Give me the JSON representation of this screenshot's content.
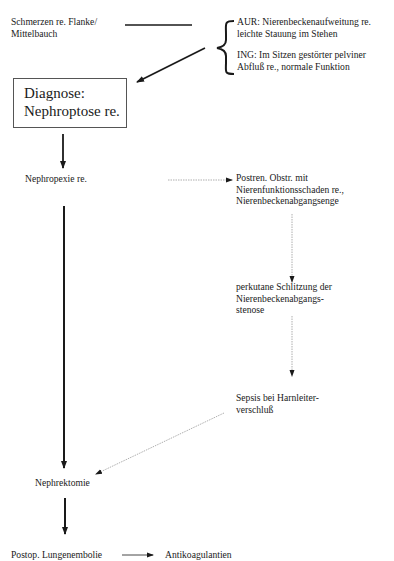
{
  "diagram": {
    "type": "flowchart",
    "nodes": {
      "symptom": {
        "line1": "Schmerzen re. Flanke/",
        "line2": "Mittelbauch"
      },
      "aur": {
        "line1": "AUR: Nierenbeckenaufweitung re.",
        "line2": "leichte Stauung im Stehen"
      },
      "ing": {
        "line1": "ING: Im Sitzen gestörter pelviner",
        "line2": "Abfluß re., normale Funktion"
      },
      "diagnosis": {
        "line1": "Diagnose:",
        "line2": "Nephroptose re."
      },
      "nephropexie": {
        "label": "Nephropexie re."
      },
      "postren": {
        "line1": "Postren. Obstr. mit",
        "line2": "Nierenfunktionsschaden re.,",
        "line3": "Nierenbeckenabgangsenge"
      },
      "perkutane": {
        "line1": "perkutane Schlitzung der",
        "line2": "Nierenbeckenabgangs-",
        "line3": "stenose"
      },
      "sepsis": {
        "line1": "Sepsis bei Harnleiter-",
        "line2": "verschluß"
      },
      "nephrektomie": {
        "label": "Nephrektomie"
      },
      "lungenembolie": {
        "label": "Postop. Lungenembolie"
      },
      "antikoagulantien": {
        "label": "Antikoagulantien"
      }
    },
    "edges": [
      {
        "from": "symptom",
        "to": "findings",
        "style": "solid-line"
      },
      {
        "from": "findings",
        "to": "diagnosis",
        "style": "solid-arrow"
      },
      {
        "from": "diagnosis",
        "to": "nephropexie",
        "style": "bold-arrow"
      },
      {
        "from": "nephropexie",
        "to": "postren",
        "style": "dotted-arrow"
      },
      {
        "from": "postren",
        "to": "perkutane",
        "style": "dotted-arrow"
      },
      {
        "from": "perkutane",
        "to": "sepsis",
        "style": "dotted-arrow"
      },
      {
        "from": "sepsis",
        "to": "nephrektomie",
        "style": "dotted-arrow"
      },
      {
        "from": "nephropexie",
        "to": "nephrektomie",
        "style": "bold-arrow"
      },
      {
        "from": "nephrektomie",
        "to": "lungenembolie",
        "style": "bold-arrow"
      },
      {
        "from": "lungenembolie",
        "to": "antikoagulantien",
        "style": "thin-arrow"
      }
    ],
    "colors": {
      "ink": "#1a1a1a",
      "dotted": "#9a9a9a",
      "box_border": "#555555",
      "background": "#ffffff"
    }
  }
}
